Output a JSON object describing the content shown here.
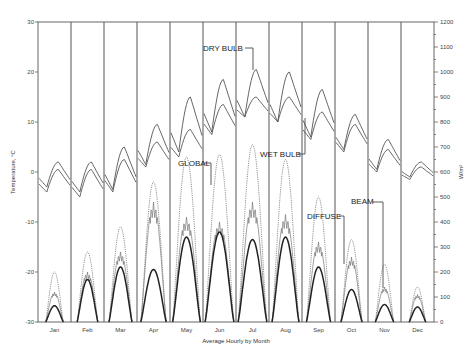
{
  "chart_data": {
    "type": "line",
    "title": "",
    "xlabel": "Average Hourly by Month",
    "ylabel": "Temperature, °C",
    "y2label": "W/m²",
    "ylim": [
      -30,
      30
    ],
    "y2lim": [
      0,
      1200
    ],
    "yticks": [
      30,
      20,
      10,
      0,
      -10,
      -20,
      -30
    ],
    "y2ticks": [
      1200,
      1100,
      1000,
      900,
      800,
      700,
      600,
      500,
      400,
      300,
      200,
      100,
      0
    ],
    "categories": [
      "Jan",
      "Feb",
      "Mar",
      "Apr",
      "May",
      "Jun",
      "Jul",
      "Aug",
      "Sep",
      "Oct",
      "Nov",
      "Dec"
    ],
    "grid": false,
    "legend": "inline annotations",
    "annotations": [
      "DRY BULB",
      "WET BULB",
      "GLOBAL",
      "DIFFUSE",
      "BEAM"
    ],
    "series": [
      {
        "name": "DRY BULB",
        "axis": "left",
        "unit": "°C",
        "style": "solid",
        "daily_min": [
          -3,
          -4,
          -3.5,
          1.5,
          4,
          8,
          11,
          10,
          7,
          4.5,
          0.5,
          -1
        ],
        "daily_max": [
          2,
          2,
          5,
          9.5,
          15,
          18.5,
          20.5,
          20,
          16.5,
          11.5,
          6.5,
          2
        ]
      },
      {
        "name": "WET BULB",
        "axis": "left",
        "unit": "°C",
        "style": "solid",
        "daily_min": [
          -4,
          -5,
          -4,
          1,
          3,
          7.5,
          11,
          10,
          6.5,
          4,
          0,
          -1.5
        ],
        "daily_max": [
          0.5,
          0.5,
          2.5,
          6,
          8.5,
          13.5,
          15,
          15,
          12,
          9.5,
          4.5,
          1
        ]
      },
      {
        "name": "GLOBAL",
        "axis": "right",
        "unit": "W/m²",
        "style": "dotted",
        "peak": [
          200,
          280,
          380,
          560,
          660,
          670,
          710,
          650,
          500,
          330,
          230,
          140
        ]
      },
      {
        "name": "DIFFUSE",
        "axis": "right",
        "unit": "W/m²",
        "style": "thin solid",
        "peak": [
          120,
          200,
          280,
          480,
          420,
          400,
          480,
          430,
          320,
          260,
          140,
          110
        ]
      },
      {
        "name": "BEAM",
        "axis": "right",
        "unit": "W/m²",
        "style": "thick solid",
        "peak": [
          65,
          170,
          220,
          210,
          340,
          360,
          330,
          340,
          220,
          130,
          70,
          60
        ]
      }
    ]
  },
  "labels": {
    "xlabel": "Average Hourly by Month",
    "ylabel": "Temperature, °C",
    "y2label": "W/m²",
    "dry_bulb": "DRY BULB",
    "wet_bulb": "WET BULB",
    "global": "GLOBAL",
    "diffuse": "DIFFUSE",
    "beam": "BEAM"
  }
}
